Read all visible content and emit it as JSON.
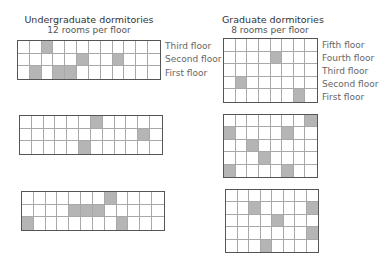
{
  "undergrad": {
    "title": "Undergraduate dormitories",
    "subtitle": "12 rooms per floor",
    "floor_labels": [
      "Third floor",
      "Second floor",
      "First floor"
    ],
    "cols": 12,
    "rows": 3,
    "buildings": [
      {
        "shaded": [
          [
            3
          ],
          [
            6,
            9
          ],
          [
            2,
            4,
            5
          ]
        ]
      },
      {
        "shaded": [
          [
            7
          ],
          [
            11
          ],
          [
            6
          ]
        ]
      },
      {
        "shaded": [
          [
            8
          ],
          [
            5,
            6,
            7
          ],
          [
            1,
            9
          ]
        ]
      }
    ]
  },
  "grad": {
    "title": "Graduate dormitories",
    "subtitle": "8 rooms per floor",
    "floor_labels": [
      "Fifth floor",
      "Fourth floor",
      "Third floor",
      "Second floor",
      "First floor"
    ],
    "cols": 8,
    "rows": 5,
    "buildings": [
      {
        "shaded": [
          [],
          [
            5
          ],
          [],
          [
            2
          ],
          [
            7
          ]
        ]
      },
      {
        "shaded": [
          [
            8
          ],
          [
            1,
            6
          ],
          [
            3
          ],
          [
            4
          ],
          [
            1,
            6
          ]
        ]
      },
      {
        "shaded": [
          [],
          [
            3,
            8
          ],
          [
            5
          ],
          [
            8
          ],
          [
            4
          ]
        ]
      }
    ]
  },
  "colors": {
    "shaded": "#b5b5b5",
    "empty": "#ffffff",
    "border": "#555555",
    "gridline": "#a8a8a8"
  }
}
